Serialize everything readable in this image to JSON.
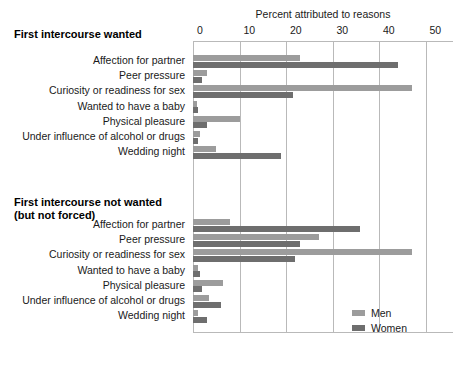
{
  "chart_data": {
    "type": "bar",
    "orientation": "horizontal",
    "title": "Percent attributed to reasons",
    "xlabel": "",
    "ylabel": "",
    "xlim": [
      0,
      60
    ],
    "xticks": [
      0,
      10,
      20,
      30,
      40,
      50,
      60
    ],
    "grid": true,
    "legend_position": "bottom-right",
    "legend": [
      {
        "name": "Men",
        "color": "#9c9c9c"
      },
      {
        "name": "Women",
        "color": "#6e6e6e"
      }
    ],
    "panels": [
      {
        "title": "First intercourse wanted",
        "title_line2": "",
        "categories": [
          "Affection for partner",
          "Peer pressure",
          "Curiosity or readiness for sex",
          "Wanted to have a baby",
          "Physical pleasure",
          "Under influence of alcohol or drugs",
          "Wedding night"
        ],
        "series": [
          {
            "name": "Men",
            "values": [
              23,
              3,
              47,
              0.8,
              10,
              1.5,
              5
            ]
          },
          {
            "name": "Women",
            "values": [
              44,
              2,
              21.5,
              1,
              3,
              1,
              19
            ]
          }
        ]
      },
      {
        "title": "First intercourse not wanted",
        "title_line2": "(but not forced)",
        "categories": [
          "Affection for partner",
          "Peer pressure",
          "Curiosity or readiness for sex",
          "Wanted to have a baby",
          "Physical pleasure",
          "Under influence of alcohol or drugs",
          "Wedding night"
        ],
        "series": [
          {
            "name": "Men",
            "values": [
              8,
              27,
              47,
              1,
              6.5,
              3.5,
              1
            ]
          },
          {
            "name": "Women",
            "values": [
              36,
              23,
              22,
              1.5,
              2,
              6,
              3
            ]
          }
        ]
      }
    ]
  }
}
